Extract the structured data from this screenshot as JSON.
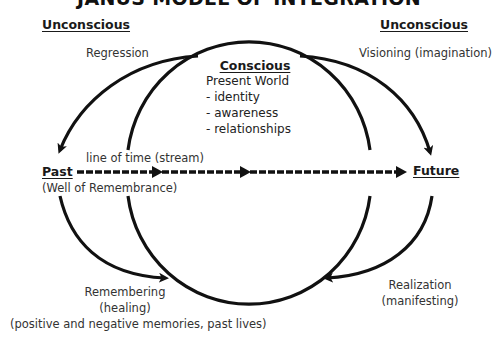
{
  "title": "JANUS MODEL OF INTEGRATION",
  "headers": {
    "unconscious_left": "Unconscious",
    "unconscious_right": "Unconscious",
    "past": "Past",
    "future": "Future"
  },
  "labels": {
    "regression": "Regression",
    "visioning": "Visioning (imagination)",
    "line_of_time": "line of time (stream)",
    "well_of_remembrance": "(Well of Remembrance)",
    "remembering": "Remembering",
    "healing": "(healing)",
    "memories": "(positive and negative memories, past lives)",
    "realization": "Realization",
    "manifesting": "(manifesting)"
  },
  "conscious": {
    "title": "Conscious",
    "items": [
      "Present World",
      "- identity",
      "- awareness",
      "- relationships"
    ]
  },
  "colors": {
    "stroke": "#111111",
    "text": "#333333"
  }
}
